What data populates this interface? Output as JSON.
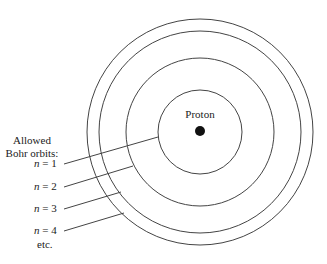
{
  "diagram": {
    "nucleus_label": "Proton",
    "legend_title_line1": "Allowed",
    "legend_title_line2": "Bohr orbits:",
    "orbits": [
      {
        "var": "n",
        "eq": " = 1"
      },
      {
        "var": "n",
        "eq": " = 2"
      },
      {
        "var": "n",
        "eq": " = 3"
      },
      {
        "var": "n",
        "eq": " = 4"
      }
    ],
    "etc_label": "etc."
  }
}
